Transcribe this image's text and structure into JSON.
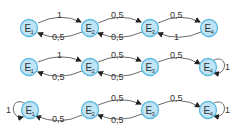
{
  "diagrams": [
    {
      "states": [
        {
          "name": "E",
          "sub": "1"
        },
        {
          "name": "E",
          "sub": "2"
        },
        {
          "name": "E",
          "sub": "3"
        },
        {
          "name": "E",
          "sub": "4"
        }
      ],
      "transitions": [
        {
          "from": "E1",
          "to": "E2",
          "label": "1"
        },
        {
          "from": "E2",
          "to": "E1",
          "label": "0,5"
        },
        {
          "from": "E2",
          "to": "E3",
          "label": "0,5"
        },
        {
          "from": "E3",
          "to": "E2",
          "label": "0,5"
        },
        {
          "from": "E3",
          "to": "E4",
          "label": "0,5"
        },
        {
          "from": "E4",
          "to": "E3",
          "label": "1"
        }
      ]
    },
    {
      "states": [
        {
          "name": "E",
          "sub": "1"
        },
        {
          "name": "E",
          "sub": "2"
        },
        {
          "name": "E",
          "sub": "3"
        },
        {
          "name": "E",
          "sub": "4"
        }
      ],
      "transitions": [
        {
          "from": "E1",
          "to": "E2",
          "label": "1"
        },
        {
          "from": "E2",
          "to": "E1",
          "label": "0,5"
        },
        {
          "from": "E2",
          "to": "E3",
          "label": "0,5"
        },
        {
          "from": "E3",
          "to": "E2",
          "label": "0,5"
        },
        {
          "from": "E3",
          "to": "E4",
          "label": "0,5"
        },
        {
          "from": "E4",
          "to": "E4",
          "label": "1"
        }
      ]
    },
    {
      "states": [
        {
          "name": "E",
          "sub": "1"
        },
        {
          "name": "E",
          "sub": "2"
        },
        {
          "name": "E",
          "sub": "3"
        },
        {
          "name": "E",
          "sub": "4"
        }
      ],
      "transitions": [
        {
          "from": "E1",
          "to": "E1",
          "label": "1"
        },
        {
          "from": "E2",
          "to": "E1",
          "label": "0,5"
        },
        {
          "from": "E2",
          "to": "E3",
          "label": "0,5"
        },
        {
          "from": "E3",
          "to": "E2",
          "label": "0,5"
        },
        {
          "from": "E3",
          "to": "E4",
          "label": "0,5"
        },
        {
          "from": "E4",
          "to": "E4",
          "label": "1"
        }
      ]
    }
  ]
}
